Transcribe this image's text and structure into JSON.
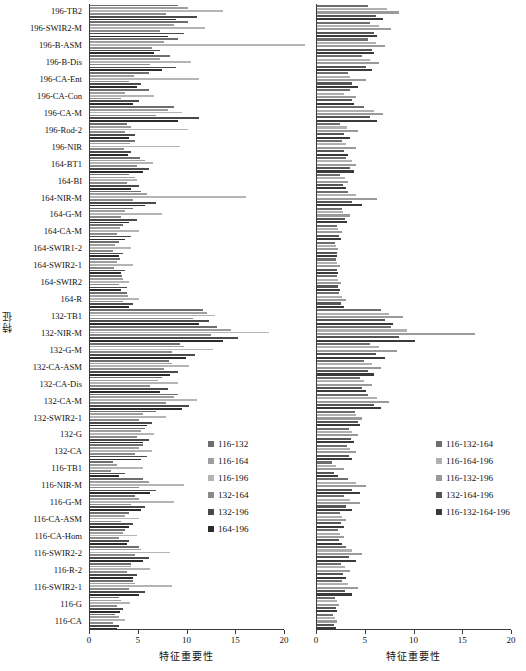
{
  "figure": {
    "y_axis_title": "特征",
    "x_axis_title": "特征重要性",
    "x_ticks": [
      "0",
      "5",
      "10",
      "15",
      "20"
    ],
    "x_tick_values": [
      0,
      5,
      10,
      15,
      20
    ],
    "categories": [
      "196-TB2",
      "196-SWIR2-M",
      "196-B-ASM",
      "196-B-Dis",
      "196-CA-Ent",
      "196-CA-Con",
      "196-CA-M",
      "196-Rod-2",
      "196-NIR",
      "164-BT1",
      "164-BI",
      "164-NIR-M",
      "164-G-M",
      "164-CA-M",
      "164-SWIR1-2",
      "164-SWIR2-1",
      "164-SWIR2",
      "164-R",
      "132-TB1",
      "132-NIR-M",
      "132-G-M",
      "132-CA-ASM",
      "132-CA-Dis",
      "132-CA-M",
      "132-SWIR2-1",
      "132-G",
      "132-CA",
      "116-TB1",
      "116-NIR-M",
      "116-G-M",
      "116-CA-ASM",
      "116-CA-Hom",
      "116-SWIR2-2",
      "116-R-2",
      "116-SWIR2-1",
      "116-G",
      "116-CA"
    ]
  },
  "chart_data": [
    {
      "type": "bar",
      "orientation": "horizontal",
      "panel": "left",
      "title": "",
      "xlabel": "特征重要性",
      "ylabel": "特征",
      "xlim": [
        0,
        20
      ],
      "grid": false,
      "legend_position": "center-right",
      "categories": [
        "196-TB2",
        "196-SWIR2-M",
        "196-B-ASM",
        "196-B-Dis",
        "196-CA-Ent",
        "196-CA-Con",
        "196-CA-M",
        "196-Rod-2",
        "196-NIR",
        "164-BT1",
        "164-BI",
        "164-NIR-M",
        "164-G-M",
        "164-CA-M",
        "164-SWIR1-2",
        "164-SWIR2-1",
        "164-SWIR2",
        "164-R",
        "132-TB1",
        "132-NIR-M",
        "132-G-M",
        "132-CA-ASM",
        "132-CA-Dis",
        "132-CA-M",
        "132-SWIR2-1",
        "132-G",
        "132-CA",
        "116-TB1",
        "116-NIR-M",
        "116-G-M",
        "116-CA-ASM",
        "116-CA-Hom",
        "116-SWIR2-2",
        "116-R-2",
        "116-SWIR2-1",
        "116-G",
        "116-CA"
      ],
      "series": [
        {
          "name": "116-132",
          "color": "#6e6e6e",
          "values": [
            9.0,
            10.0,
            9.0,
            8.2,
            6.0,
            6.1,
            8.6,
            3.8,
            4.6,
            5.1,
            4.0,
            5.2,
            4.4,
            3.4,
            3.0,
            3.1,
            3.3,
            3.8,
            11.6,
            13.0,
            9.2,
            8.1,
            7.4,
            9.0,
            6.8,
            5.6,
            5.4,
            2.4,
            5.4,
            4.6,
            4.0,
            3.6,
            5.0,
            4.2,
            4.4,
            3.0,
            2.6
          ]
        },
        {
          "name": "116-164",
          "color": "#9e9e9e",
          "values": [
            10.0,
            8.6,
            7.6,
            7.2,
            4.5,
            3.6,
            8.0,
            4.2,
            4.1,
            5.6,
            4.6,
            5.8,
            3.6,
            3.1,
            2.6,
            2.8,
            3.4,
            3.9,
            12.0,
            14.5,
            9.6,
            8.4,
            7.0,
            8.6,
            5.4,
            5.2,
            5.0,
            2.8,
            6.0,
            5.0,
            3.6,
            3.4,
            5.2,
            4.2,
            4.6,
            3.2,
            3.0
          ]
        },
        {
          "name": "116-196",
          "color": "#b5b5b5",
          "values": [
            13.6,
            11.8,
            22.0,
            10.4,
            11.2,
            6.6,
            9.4,
            10.0,
            9.2,
            6.5,
            4.8,
            16.0,
            7.4,
            5.0,
            4.2,
            4.4,
            4.0,
            5.0,
            12.8,
            18.4,
            12.6,
            10.2,
            9.0,
            11.0,
            7.8,
            6.6,
            6.4,
            5.4,
            9.6,
            8.6,
            5.0,
            4.8,
            8.2,
            6.2,
            8.4,
            4.1,
            3.6
          ]
        },
        {
          "name": "132-164",
          "color": "#8a8a8a",
          "values": [
            7.8,
            7.2,
            6.4,
            6.2,
            4.0,
            3.2,
            6.8,
            3.6,
            3.5,
            4.8,
            3.8,
            4.4,
            3.2,
            2.8,
            2.4,
            2.5,
            3.0,
            3.4,
            10.6,
            12.4,
            8.4,
            7.6,
            6.2,
            7.8,
            5.0,
            4.8,
            4.6,
            2.2,
            5.0,
            4.2,
            3.2,
            3.0,
            4.6,
            3.8,
            4.0,
            2.8,
            2.4
          ]
        },
        {
          "name": "132-196",
          "color": "#4a4a4a",
          "values": [
            11.0,
            9.6,
            7.2,
            8.8,
            5.2,
            5.0,
            11.2,
            4.6,
            4.2,
            6.0,
            5.0,
            6.8,
            4.8,
            4.2,
            3.4,
            3.6,
            3.8,
            4.4,
            12.2,
            15.2,
            10.8,
            9.0,
            8.0,
            10.2,
            6.4,
            6.0,
            5.8,
            3.6,
            6.8,
            5.6,
            4.4,
            4.0,
            6.0,
            4.8,
            5.6,
            3.4,
            3.0
          ]
        },
        {
          "name": "164-196",
          "color": "#2b2b2b",
          "values": [
            8.8,
            8.0,
            6.6,
            7.4,
            4.8,
            4.4,
            9.0,
            4.0,
            3.9,
            5.4,
            4.2,
            5.6,
            4.0,
            3.6,
            3.0,
            3.2,
            3.2,
            4.0,
            11.2,
            13.6,
            9.8,
            8.2,
            7.2,
            9.4,
            5.8,
            5.4,
            5.2,
            3.0,
            6.2,
            5.2,
            4.0,
            3.8,
            5.4,
            4.4,
            5.0,
            3.1,
            2.8
          ]
        }
      ]
    },
    {
      "type": "bar",
      "orientation": "horizontal",
      "panel": "right",
      "title": "",
      "xlabel": "特征重要性",
      "ylabel": "",
      "xlim": [
        0,
        20
      ],
      "grid": false,
      "legend_position": "center-right",
      "categories": [
        "196-TB2",
        "196-SWIR2-M",
        "196-B-ASM",
        "196-B-Dis",
        "196-CA-Ent",
        "196-CA-Con",
        "196-CA-M",
        "196-Rod-2",
        "196-NIR",
        "164-BT1",
        "164-BI",
        "164-NIR-M",
        "164-G-M",
        "164-CA-M",
        "164-SWIR1-2",
        "164-SWIR2-1",
        "164-SWIR2",
        "164-R",
        "132-TB1",
        "132-NIR-M",
        "132-G-M",
        "132-CA-ASM",
        "132-CA-Dis",
        "132-CA-M",
        "132-SWIR2-1",
        "132-G",
        "132-CA",
        "116-TB1",
        "116-NIR-M",
        "116-G-M",
        "116-CA-ASM",
        "116-CA-Hom",
        "116-SWIR2-2",
        "116-R-2",
        "116-SWIR2-1",
        "116-G",
        "116-CA"
      ],
      "series": [
        {
          "name": "116-132-164",
          "color": "#6e6e6e",
          "values": [
            5.2,
            5.4,
            5.2,
            4.6,
            3.2,
            3.4,
            4.8,
            2.4,
            2.6,
            3.0,
            2.4,
            3.2,
            2.6,
            2.0,
            1.8,
            1.9,
            2.0,
            2.3,
            6.6,
            7.6,
            5.4,
            4.8,
            4.4,
            5.2,
            3.9,
            3.3,
            3.1,
            1.5,
            3.2,
            2.8,
            2.4,
            2.2,
            3.0,
            2.5,
            2.6,
            1.8,
            1.6
          ]
        },
        {
          "name": "116-164-196",
          "color": "#b0b0b0",
          "values": [
            7.2,
            6.4,
            6.0,
            5.4,
            3.4,
            2.8,
            5.8,
            3.1,
            3.0,
            3.6,
            2.9,
            4.0,
            2.7,
            2.2,
            1.9,
            2.0,
            2.2,
            2.6,
            7.4,
            9.2,
            6.4,
            5.6,
            4.8,
            6.2,
            4.0,
            3.6,
            3.4,
            1.9,
            4.0,
            3.4,
            2.6,
            2.4,
            3.6,
            2.9,
            3.2,
            2.0,
            1.8
          ]
        },
        {
          "name": "116-132-196",
          "color": "#9a9a9a",
          "values": [
            8.4,
            7.6,
            7.0,
            6.4,
            5.0,
            4.0,
            6.8,
            4.2,
            4.0,
            4.0,
            3.2,
            6.2,
            3.4,
            2.6,
            2.2,
            2.4,
            2.5,
            3.0,
            8.8,
            16.2,
            8.2,
            6.6,
            5.6,
            7.4,
            4.6,
            4.2,
            4.0,
            2.8,
            5.0,
            4.4,
            3.0,
            2.8,
            4.6,
            3.4,
            4.2,
            2.3,
            2.0
          ]
        },
        {
          "name": "132-164-196",
          "color": "#555555",
          "values": [
            6.0,
            5.8,
            5.6,
            5.0,
            3.6,
            3.6,
            5.4,
            2.8,
            2.8,
            3.4,
            2.7,
            3.6,
            2.9,
            2.3,
            2.0,
            2.1,
            2.2,
            2.5,
            7.0,
            8.4,
            6.0,
            5.2,
            4.6,
            5.8,
            4.2,
            3.5,
            3.3,
            1.7,
            3.6,
            3.0,
            2.5,
            2.3,
            3.3,
            2.7,
            2.9,
            1.9,
            1.7
          ]
        },
        {
          "name": "116-132-164-196",
          "color": "#3a3a3a",
          "values": [
            6.8,
            6.2,
            5.8,
            5.6,
            4.2,
            3.8,
            6.2,
            3.4,
            3.2,
            3.8,
            3.0,
            4.6,
            3.1,
            2.5,
            2.1,
            2.2,
            2.4,
            2.8,
            7.8,
            10.0,
            7.0,
            5.8,
            5.0,
            6.6,
            4.4,
            3.8,
            3.6,
            2.2,
            4.4,
            3.6,
            2.8,
            2.6,
            4.0,
            3.0,
            3.6,
            2.1,
            1.9
          ]
        }
      ]
    }
  ],
  "legends": {
    "left": [
      {
        "label": "116-132",
        "color": "#6e6e6e"
      },
      {
        "label": "116-164",
        "color": "#9e9e9e"
      },
      {
        "label": "116-196",
        "color": "#b5b5b5"
      },
      {
        "label": "132-164",
        "color": "#8a8a8a"
      },
      {
        "label": "132-196",
        "color": "#4a4a4a"
      },
      {
        "label": "164-196",
        "color": "#2b2b2b"
      }
    ],
    "right": [
      {
        "label": "116-132-164",
        "color": "#6e6e6e"
      },
      {
        "label": "116-164-196",
        "color": "#b0b0b0"
      },
      {
        "label": "116-132-196",
        "color": "#9a9a9a"
      },
      {
        "label": "132-164-196",
        "color": "#555555"
      },
      {
        "label": "116-132-164-196",
        "color": "#3a3a3a"
      }
    ]
  }
}
